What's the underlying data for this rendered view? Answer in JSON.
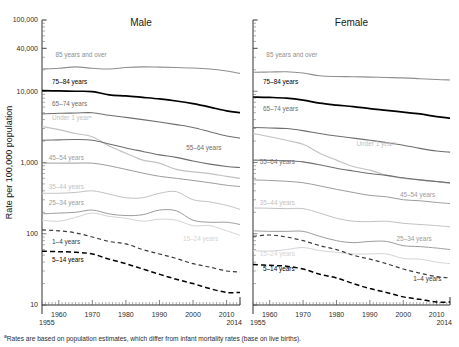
{
  "figure": {
    "ylabel": "Rate per 100,000 population",
    "footnote_marker": "a",
    "footnote": "Rates are based on population estimates, which differ from infant mortality rates (base on live births).",
    "y_ticks": [
      "100,000",
      "40,000",
      "10,000",
      "1,000",
      "100",
      "10"
    ],
    "x_ticks": [
      "1960",
      "1970",
      "1980",
      "1990",
      "2000",
      "2010"
    ],
    "x_start_label": "1955",
    "x_end_label": "2014"
  },
  "chart_data": {
    "type": "line",
    "title": "",
    "xlabel": "",
    "ylabel": "Rate per 100,000 population",
    "yscale": "log",
    "ylim": [
      10,
      100000
    ],
    "xlim": [
      1955,
      2014
    ],
    "grid": false,
    "legend": "inline-labels",
    "x": [
      1955,
      1960,
      1965,
      1970,
      1975,
      1980,
      1985,
      1990,
      1995,
      2000,
      2005,
      2010,
      2014
    ],
    "panels": [
      {
        "name": "Male",
        "title": "Male",
        "series": [
          {
            "name": "85 years and over",
            "color": "#8f8f8f",
            "style": "solid",
            "width": 1.1,
            "label_x": 1959,
            "label_y": 30000,
            "values": [
              20500,
              21000,
              22000,
              21000,
              20500,
              21500,
              22000,
              21800,
              21500,
              21200,
              20500,
              19200,
              17800
            ]
          },
          {
            "name": "75–84 years",
            "color": "#000000",
            "style": "solid",
            "width": 1.7,
            "label_x": 1958,
            "label_y": 12600,
            "values": [
              10200,
              10100,
              10000,
              9900,
              8900,
              8600,
              8200,
              7800,
              7300,
              6700,
              6000,
              5300,
              5000
            ]
          },
          {
            "name": "65–74 years",
            "color": "#6e6e6e",
            "style": "solid",
            "width": 1.1,
            "label_x": 1958,
            "label_y": 6200,
            "values": [
              4800,
              4900,
              4950,
              5000,
              4600,
              4300,
              4000,
              3700,
              3400,
              3100,
              2700,
              2350,
              2200
            ]
          },
          {
            "name": "Under 1 year",
            "color": "#c2c2c2",
            "style": "solid",
            "width": 1.2,
            "label_x": 1958,
            "label_y": 4000,
            "values": [
              3200,
              2900,
              2550,
              2300,
              1700,
              1350,
              1080,
              980,
              800,
              740,
              700,
              640,
              600
            ]
          },
          {
            "name": "55–64 years",
            "color": "#6e6e6e",
            "style": "solid",
            "width": 1.1,
            "label_x": 1998,
            "label_y": 1500,
            "values": [
              2050,
              2080,
              2100,
              2050,
              1820,
              1600,
              1430,
              1280,
              1180,
              1050,
              950,
              880,
              850
            ]
          },
          {
            "name": "45–54 years",
            "color": "#9c9c9c",
            "style": "solid",
            "width": 1.0,
            "label_x": 1957,
            "label_y": 1100,
            "values": [
              980,
              980,
              980,
              980,
              900,
              800,
              710,
              640,
              600,
              560,
              520,
              480,
              460
            ]
          },
          {
            "name": "35–44 years",
            "color": "#c2c2c2",
            "style": "solid",
            "width": 1.0,
            "label_x": 1957,
            "label_y": 430,
            "values": [
              370,
              370,
              380,
              400,
              360,
              320,
              320,
              370,
              390,
              300,
              280,
              250,
              220
            ]
          },
          {
            "name": "25–34 years",
            "color": "#9c9c9c",
            "style": "solid",
            "width": 1.0,
            "label_x": 1957,
            "label_y": 250,
            "values": [
              190,
              195,
              200,
              215,
              190,
              180,
              185,
              215,
              210,
              155,
              145,
              145,
              135
            ]
          },
          {
            "name": "15–24 years",
            "color": "#d4d4d4",
            "style": "solid",
            "width": 1.0,
            "label_x": 1997,
            "label_y": 80,
            "values": [
              155,
              150,
              170,
              195,
              175,
              165,
              150,
              160,
              155,
              130,
              130,
              110,
              95
            ]
          },
          {
            "name": "1–4 years",
            "color": "#3a3a3a",
            "style": "dashed",
            "width": 1.2,
            "label_x": 1958,
            "label_y": 72,
            "values": [
              113,
              110,
              103,
              90,
              78,
              72,
              60,
              52,
              45,
              38,
              34,
              30,
              29
            ]
          },
          {
            "name": "5–14 years",
            "color": "#000000",
            "style": "dashed",
            "width": 1.5,
            "label_x": 1958,
            "label_y": 40,
            "values": [
              57,
              56,
              55,
              52,
              44,
              38,
              32,
              27,
              23,
              20,
              17,
              15,
              15
            ]
          }
        ]
      },
      {
        "name": "Female",
        "title": "Female",
        "series": [
          {
            "name": "85 years and over",
            "color": "#8f8f8f",
            "style": "solid",
            "width": 1.1,
            "label_x": 1959,
            "label_y": 30000,
            "values": [
              18500,
              18600,
              18800,
              18000,
              16500,
              16100,
              16000,
              15800,
              15600,
              15400,
              15000,
              14600,
              14400
            ]
          },
          {
            "name": "75–84 years",
            "color": "#000000",
            "style": "solid",
            "width": 1.7,
            "label_x": 1958,
            "label_y": 12600,
            "values": [
              8300,
              8200,
              8000,
              7500,
              6800,
              6400,
              6100,
              5700,
              5400,
              5100,
              4800,
              4400,
              4200
            ]
          },
          {
            "name": "65–74 years",
            "color": "#6e6e6e",
            "style": "solid",
            "width": 1.1,
            "label_x": 1958,
            "label_y": 5200,
            "values": [
              3100,
              3050,
              3000,
              2800,
              2550,
              2350,
              2200,
              2050,
              1900,
              1750,
              1580,
              1450,
              1400
            ]
          },
          {
            "name": "Under 1 year",
            "color": "#c2c2c2",
            "style": "solid",
            "width": 1.2,
            "label_x": 1986,
            "label_y": 1700,
            "values": [
              2550,
              2300,
              2050,
              1800,
              1350,
              1080,
              880,
              780,
              660,
              600,
              570,
              540,
              510
            ]
          },
          {
            "name": "55–64 years",
            "color": "#6e6e6e",
            "style": "solid",
            "width": 1.1,
            "label_x": 1957,
            "label_y": 950,
            "values": [
              1080,
              1070,
              1060,
              1020,
              930,
              830,
              760,
              700,
              660,
              610,
              570,
              540,
              520
            ]
          },
          {
            "name": "45–54 years",
            "color": "#9c9c9c",
            "style": "solid",
            "width": 1.0,
            "label_x": 1999,
            "label_y": 330,
            "values": [
              570,
              560,
              545,
              520,
              470,
              420,
              380,
              345,
              330,
              300,
              290,
              275,
              265
            ]
          },
          {
            "name": "35–44 years",
            "color": "#c2c2c2",
            "style": "solid",
            "width": 1.0,
            "label_x": 1957,
            "label_y": 250,
            "values": [
              230,
              228,
              225,
              225,
              195,
              165,
              150,
              148,
              150,
              140,
              135,
              130,
              125
            ]
          },
          {
            "name": "25–34 years",
            "color": "#9c9c9c",
            "style": "solid",
            "width": 1.0,
            "label_x": 1998,
            "label_y": 78,
            "values": [
              110,
              108,
              108,
              108,
              92,
              80,
              75,
              78,
              78,
              68,
              66,
              63,
              60
            ]
          },
          {
            "name": "15–24 years",
            "color": "#d4d4d4",
            "style": "solid",
            "width": 1.0,
            "label_x": 1957,
            "label_y": 48,
            "values": [
              58,
              57,
              60,
              64,
              58,
              55,
              52,
              52,
              52,
              45,
              44,
              40,
              38
            ]
          },
          {
            "name": "1–4 years",
            "color": "#3a3a3a",
            "style": "dashed",
            "width": 1.2,
            "label_x": 2003,
            "label_y": 22,
            "values": [
              92,
              96,
              90,
              80,
              68,
              60,
              50,
              44,
              38,
              32,
              28,
              25,
              24
            ]
          },
          {
            "name": "5–14 years",
            "color": "#000000",
            "style": "dashed",
            "width": 1.5,
            "label_x": 1958,
            "label_y": 30,
            "values": [
              37,
              36,
              35,
              32,
              27,
              24,
              20,
              17,
              15,
              13,
              12,
              11,
              11
            ]
          }
        ]
      }
    ]
  }
}
